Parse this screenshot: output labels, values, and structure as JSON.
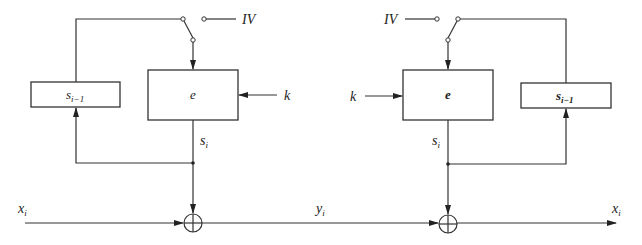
{
  "diagram": {
    "type": "block-diagram",
    "colors": {
      "line": "#333333",
      "background": "#ffffff"
    },
    "encryptor": {
      "register_label": "s",
      "register_sub": "i−1",
      "cipher_label": "e",
      "key_label": "k",
      "iv_label": "IV",
      "keystream_label": "s",
      "keystream_sub": "i",
      "input_label": "x",
      "input_sub": "i"
    },
    "channel": {
      "label": "y",
      "sub": "i"
    },
    "decryptor": {
      "register_label": "s",
      "register_sub": "i−1",
      "cipher_label": "e",
      "key_label": "k",
      "iv_label": "IV",
      "keystream_label": "s",
      "keystream_sub": "i",
      "output_label": "x",
      "output_sub": "i"
    }
  }
}
